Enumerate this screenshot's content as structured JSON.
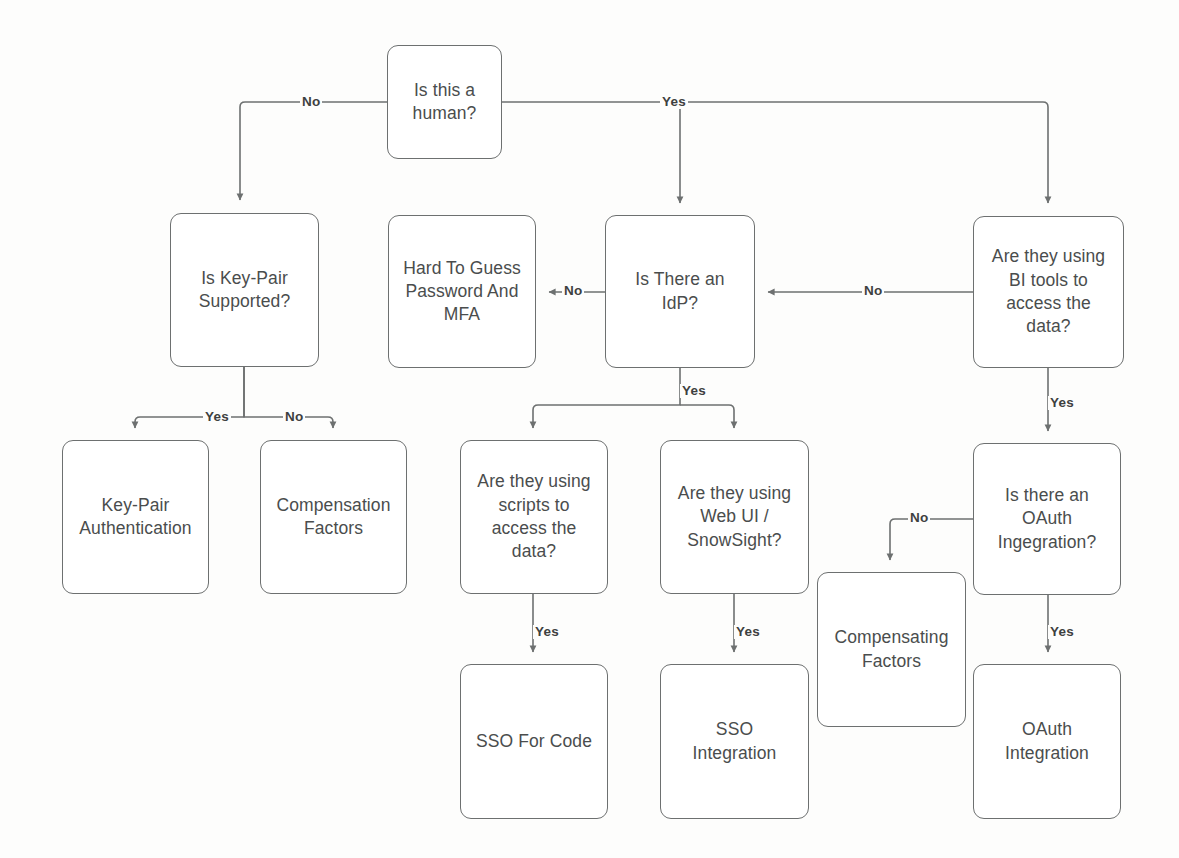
{
  "diagram": {
    "stroke_color": "#6d7070",
    "text_color": "#4a4d4d",
    "label_color": "#3d4040",
    "background": "#fdfdfc",
    "width": 1179,
    "height": 858,
    "nodes": [
      {
        "id": "is-human",
        "label": "Is this a\nhuman?",
        "x": 387,
        "y": 45,
        "w": 115,
        "h": 114,
        "type": "decision"
      },
      {
        "id": "key-pair-supported",
        "label": "Is Key-Pair\nSupported?",
        "x": 170,
        "y": 213,
        "w": 149,
        "h": 154,
        "type": "decision"
      },
      {
        "id": "hard-to-guess",
        "label": "Hard To Guess\nPassword And\nMFA",
        "x": 388,
        "y": 215,
        "w": 148,
        "h": 153,
        "type": "outcome"
      },
      {
        "id": "is-there-idp",
        "label": "Is There an\nIdP?",
        "x": 605,
        "y": 215,
        "w": 150,
        "h": 153,
        "type": "decision"
      },
      {
        "id": "bi-tools",
        "label": "Are they using\nBI tools to\naccess the\ndata?",
        "x": 973,
        "y": 216,
        "w": 151,
        "h": 152,
        "type": "decision"
      },
      {
        "id": "key-pair-auth",
        "label": "Key-Pair\nAuthentication",
        "x": 62,
        "y": 440,
        "w": 147,
        "h": 154,
        "type": "outcome"
      },
      {
        "id": "compensation-factors",
        "label": "Compensation\nFactors",
        "x": 260,
        "y": 440,
        "w": 147,
        "h": 154,
        "type": "outcome"
      },
      {
        "id": "scripts",
        "label": "Are they using\nscripts to\naccess the\ndata?",
        "x": 460,
        "y": 440,
        "w": 148,
        "h": 154,
        "type": "decision"
      },
      {
        "id": "web-ui",
        "label": "Are they using\nWeb UI /\nSnowSight?",
        "x": 660,
        "y": 440,
        "w": 149,
        "h": 154,
        "type": "decision"
      },
      {
        "id": "oauth-question",
        "label": "Is there an\nOAuth\nIngegration?",
        "x": 973,
        "y": 443,
        "w": 148,
        "h": 152,
        "type": "decision"
      },
      {
        "id": "compensating-factors",
        "label": "Compensating\nFactors",
        "x": 817,
        "y": 572,
        "w": 149,
        "h": 155,
        "type": "outcome"
      },
      {
        "id": "sso-for-code",
        "label": "SSO For Code",
        "x": 460,
        "y": 664,
        "w": 148,
        "h": 155,
        "type": "outcome"
      },
      {
        "id": "sso-integration",
        "label": "SSO\nIntegration",
        "x": 660,
        "y": 664,
        "w": 149,
        "h": 155,
        "type": "outcome"
      },
      {
        "id": "oauth-integration",
        "label": "OAuth\nIntegration",
        "x": 973,
        "y": 664,
        "w": 148,
        "h": 155,
        "type": "outcome"
      }
    ],
    "edges": [
      {
        "id": "human-no",
        "from": "is-human",
        "to": "key-pair-supported",
        "label": "No",
        "label_x": 300,
        "label_y": 95,
        "path": "M 387 102 L 245 102 Q 240 102 240 107 L 240 200"
      },
      {
        "id": "human-yes",
        "from": "is-human",
        "to": "is-there-idp",
        "label": "Yes",
        "label_x": 660,
        "label_y": 95,
        "path": "M 502 102 L 1043 102 Q 1048 102 1048 107 L 1048 203"
      },
      {
        "id": "human-yes-idp",
        "from": "is-human",
        "to": "is-there-idp",
        "label": "",
        "label_x": 0,
        "label_y": 0,
        "path": "M 680 103 L 680 203"
      },
      {
        "id": "idp-no",
        "from": "is-there-idp",
        "to": "hard-to-guess",
        "label": "No",
        "label_x": 562,
        "label_y": 284,
        "path": "M 605 292 L 549 292"
      },
      {
        "id": "bi-no",
        "from": "bi-tools",
        "to": "is-there-idp",
        "label": "No",
        "label_x": 862,
        "label_y": 284,
        "path": "M 973 292 L 768 292"
      },
      {
        "id": "keypair-yes",
        "from": "key-pair-supported",
        "to": "key-pair-auth",
        "label": "Yes",
        "label_x": 203,
        "label_y": 410,
        "path": "M 244 367 L 244 417 L 140 417 Q 135 417 135 422 L 135 428"
      },
      {
        "id": "keypair-no",
        "from": "key-pair-supported",
        "to": "compensation-factors",
        "label": "No",
        "label_x": 283,
        "label_y": 410,
        "path": "M 244 367 L 244 417 L 328 417 Q 333 417 333 422 L 333 428"
      },
      {
        "id": "idp-yes",
        "from": "is-there-idp",
        "to": "scripts",
        "label": "Yes",
        "label_x": 680,
        "label_y": 384,
        "path": "M 680 368 L 680 405 L 538 405 Q 533 405 533 410 L 533 428"
      },
      {
        "id": "idp-yes-webui",
        "from": "is-there-idp",
        "to": "web-ui",
        "label": "",
        "label_x": 0,
        "label_y": 0,
        "path": "M 680 405 L 729 405 Q 734 405 734 410 L 734 428"
      },
      {
        "id": "bi-yes",
        "from": "bi-tools",
        "to": "oauth-question",
        "label": "Yes",
        "label_x": 1048,
        "label_y": 396,
        "path": "M 1048 368 L 1048 431"
      },
      {
        "id": "oauth-no",
        "from": "oauth-question",
        "to": "compensating-factors",
        "label": "No",
        "label_x": 908,
        "label_y": 511,
        "path": "M 973 519 L 895 519 Q 890 519 890 524 L 890 560"
      },
      {
        "id": "scripts-yes",
        "from": "scripts",
        "to": "sso-for-code",
        "label": "Yes",
        "label_x": 533,
        "label_y": 625,
        "path": "M 533 594 L 533 652"
      },
      {
        "id": "webui-yes",
        "from": "web-ui",
        "to": "sso-integration",
        "label": "Yes",
        "label_x": 734,
        "label_y": 625,
        "path": "M 734 594 L 734 652"
      },
      {
        "id": "oauth-yes",
        "from": "oauth-question",
        "to": "oauth-integration",
        "label": "Yes",
        "label_x": 1048,
        "label_y": 625,
        "path": "M 1048 595 L 1048 652"
      }
    ]
  }
}
